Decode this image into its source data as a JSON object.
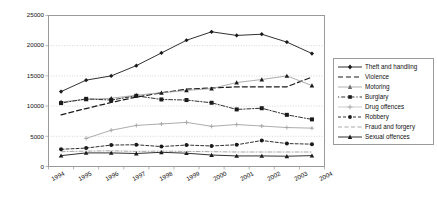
{
  "chart_data": {
    "type": "line",
    "title": "",
    "xlabel": "",
    "ylabel": "",
    "categories": [
      "1994",
      "1995",
      "1996",
      "1997",
      "1998",
      "1999",
      "2000",
      "2001",
      "2002",
      "2003",
      "2004"
    ],
    "ylim": [
      0,
      25000
    ],
    "ytick_labels": [
      "0",
      "5000",
      "10000",
      "15000",
      "20000",
      "25000"
    ],
    "ytick_values": [
      0,
      5000,
      10000,
      15000,
      20000,
      25000
    ],
    "grid": "horizontal-dotted",
    "legend_position": "right-outside",
    "series": [
      {
        "name": "Theft and handling",
        "style": "solid",
        "marker": "diamond",
        "values": [
          12400,
          14300,
          15000,
          16700,
          18800,
          20900,
          22300,
          21700,
          21900,
          20600,
          18700
        ]
      },
      {
        "name": "Violence",
        "style": "dashed",
        "marker": "none",
        "values": [
          8550,
          9600,
          10600,
          11500,
          12200,
          12800,
          13000,
          13200,
          13200,
          13200,
          14800
        ]
      },
      {
        "name": "Motoring",
        "style": "solid-light",
        "marker": "triangle",
        "values": [
          10700,
          11100,
          11300,
          11800,
          12200,
          12600,
          12900,
          13900,
          14400,
          15000,
          13400
        ]
      },
      {
        "name": "Burglary",
        "style": "dotted-dash",
        "marker": "square",
        "values": [
          10500,
          11200,
          11000,
          11700,
          11100,
          11000,
          10550,
          9450,
          9650,
          8550,
          7800
        ]
      },
      {
        "name": "Drug offences",
        "style": "solid-light",
        "marker": "plus",
        "values": [
          null,
          4650,
          6000,
          6800,
          7050,
          7300,
          6650,
          6950,
          6700,
          6450,
          6350
        ]
      },
      {
        "name": "Robbery",
        "style": "dashed-dot",
        "marker": "circle",
        "values": [
          2850,
          3050,
          3550,
          3600,
          3300,
          3550,
          3400,
          3600,
          4300,
          3800,
          3700
        ]
      },
      {
        "name": "Fraud and forgery",
        "style": "dash-dot-light",
        "marker": "none",
        "values": [
          2450,
          2550,
          2600,
          2500,
          2550,
          2500,
          2450,
          2400,
          2400,
          2400,
          2400
        ]
      },
      {
        "name": "Sexual offences",
        "style": "solid",
        "marker": "triangle",
        "values": [
          1800,
          2250,
          2250,
          2150,
          2350,
          2200,
          1900,
          1750,
          1750,
          1700,
          1800
        ]
      }
    ]
  },
  "legend": {
    "items": [
      {
        "label": "Theft and handling"
      },
      {
        "label": "Violence"
      },
      {
        "label": "Motoring"
      },
      {
        "label": "Burglary"
      },
      {
        "label": "Drug offences"
      },
      {
        "label": "Robbery"
      },
      {
        "label": "Fraud and forgery"
      },
      {
        "label": "Sexual offences"
      }
    ]
  },
  "colors": {
    "axis": "#9a9a9a",
    "grid": "#b9b9b9",
    "dark_series": "#1a1a1a",
    "light_series": "#9d9d9d",
    "background": "#ffffff"
  }
}
